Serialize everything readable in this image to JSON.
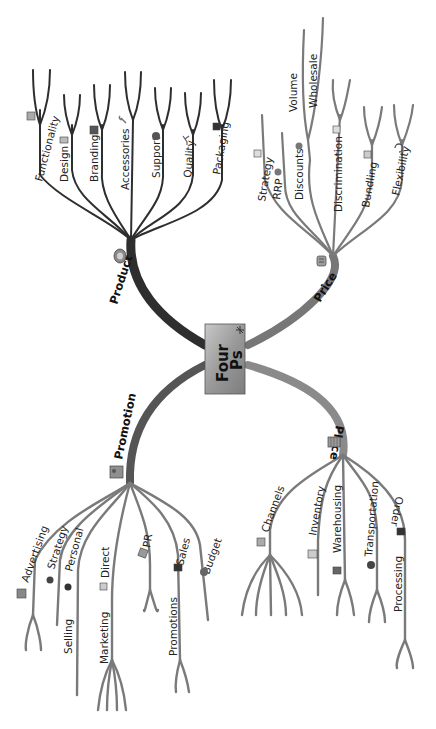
{
  "title": "Four Ps",
  "center": {
    "label_line1": "Four",
    "label_line2": "Ps"
  },
  "branches": {
    "product": {
      "label": "Product",
      "icon": "product-disc-icon",
      "children": [
        {
          "label": "Functionality",
          "icon": "chart-icon"
        },
        {
          "label": "Design",
          "icon": "design-tools-icon"
        },
        {
          "label": "Branding",
          "icon": "brand-flag-icon"
        },
        {
          "label": "Accessories",
          "icon": "wrench-icon"
        },
        {
          "label": "Support",
          "icon": "phone-icon"
        },
        {
          "label": "Quality",
          "icon": "trophy-icon"
        },
        {
          "label": "Packaging",
          "icon": "box-icon"
        }
      ]
    },
    "price": {
      "label": "Price",
      "icon": "cash-register-icon",
      "children": [
        {
          "label": "Strategy",
          "icon": "chart-icon"
        },
        {
          "label": "RRP",
          "icon": "coins-icon"
        },
        {
          "label": "Discounts",
          "icon": "coins-icon"
        },
        {
          "label": "Volume"
        },
        {
          "label": "Wholesale"
        },
        {
          "label": "Discrimination",
          "icon": "square-icon"
        },
        {
          "label": "Bundling",
          "icon": "stack-icon"
        },
        {
          "label": "Flexibility",
          "icon": "refresh-icon"
        }
      ]
    },
    "promotion": {
      "label": "Promotion",
      "icon": "megaphone-icon",
      "children": [
        {
          "label": "Advertising",
          "icon": "billboard-icon"
        },
        {
          "label": "Strategy",
          "icon": "people-icon"
        },
        {
          "label": "Personal",
          "icon": "people-icon"
        },
        {
          "label": "Selling"
        },
        {
          "label": "Direct",
          "icon": "mail-icon"
        },
        {
          "label": "Marketing"
        },
        {
          "label": "PR",
          "icon": "newspaper-icon"
        },
        {
          "label": "Sales",
          "icon": "shop-icon"
        },
        {
          "label": "Promotions"
        },
        {
          "label": "Budget",
          "icon": "pie-icon"
        }
      ]
    },
    "place": {
      "label": "Place",
      "icon": "building-icon",
      "children": [
        {
          "label": "Channels",
          "icon": "network-icon"
        },
        {
          "label": "Inventory",
          "icon": "list-icon"
        },
        {
          "label": "Warehousing",
          "icon": "warehouse-icon"
        },
        {
          "label": "Transportation",
          "icon": "truck-icon"
        },
        {
          "label": "Order",
          "icon": "factory-icon"
        },
        {
          "label": "Processing"
        }
      ]
    }
  },
  "colors": {
    "product_branch": "#2e2e2e",
    "promotion_branch": "#2e2e2e",
    "price_branch": "#7a7a7a",
    "place_branch": "#7a7a7a",
    "center_fill": "#9a9a9a",
    "background": "#ffffff"
  }
}
